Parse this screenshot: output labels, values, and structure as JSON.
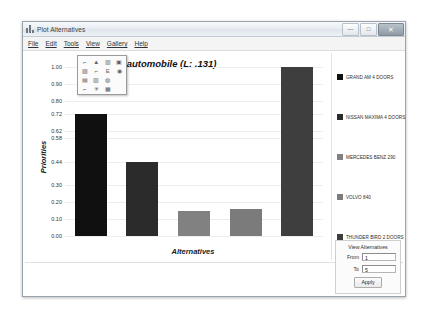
{
  "window": {
    "title": "Plot Alternatives",
    "icon": "bar-chart-icon",
    "buttons": {
      "minimize": "—",
      "maximize": "□",
      "close": "✕"
    }
  },
  "menubar": {
    "items": [
      {
        "label": "File"
      },
      {
        "label": "Edit"
      },
      {
        "label": "Tools"
      },
      {
        "label": "View"
      },
      {
        "label": "Gallery"
      },
      {
        "label": "Help"
      }
    ]
  },
  "gallery_popup": {
    "cells": [
      {
        "icon": "line-chart-icon",
        "glyph": "⌐"
      },
      {
        "icon": "area-chart-icon",
        "glyph": "▲"
      },
      {
        "icon": "bar-chart-icon",
        "glyph": "▥"
      },
      {
        "icon": "stacked-bar-icon",
        "glyph": "▣"
      },
      {
        "icon": "column-chart-icon",
        "glyph": "▨"
      },
      {
        "icon": "step-chart-icon",
        "glyph": "⌐"
      },
      {
        "icon": "histogram-icon",
        "glyph": "Ε"
      },
      {
        "icon": "pie-chart-icon",
        "glyph": "◉"
      },
      {
        "icon": "grouped-bar-icon",
        "glyph": "▤"
      },
      {
        "icon": "range-bar-icon",
        "glyph": "▥"
      },
      {
        "icon": "donut-chart-icon",
        "glyph": "◍"
      },
      {
        "icon": "blank-cell-icon",
        "glyph": ""
      },
      {
        "icon": "scatter-chart-icon",
        "glyph": "⌐"
      },
      {
        "icon": "radar-chart-icon",
        "glyph": "✳"
      },
      {
        "icon": "mixed-chart-icon",
        "glyph": "▦"
      },
      {
        "icon": "blank-cell-icon",
        "glyph": ""
      }
    ]
  },
  "chart_data": {
    "type": "bar",
    "title": "cost of automobile (L: .131)",
    "xlabel": "Alternatives",
    "ylabel": "Priorities",
    "ylim": [
      0,
      1.0
    ],
    "grid": true,
    "legend_position": "right",
    "categories": [
      "GRAND AM 4 DOORS",
      "NISSAN MAXIMA 4 DOORS",
      "MERCEDES BENZ 290",
      "VOLVO 840",
      "THUNDER BIRD 2 DOORS"
    ],
    "values": [
      0.72,
      0.44,
      0.15,
      0.16,
      1.0
    ],
    "colors": [
      "#101010",
      "#2b2b2b",
      "#818181",
      "#7b7b7b",
      "#3e3e3e"
    ],
    "ytick_labels": [
      "1.00",
      "0.90",
      "0.80",
      "0.72",
      "0.62",
      "0.58",
      "0.44",
      "0.30",
      "0.20",
      "0.10",
      "0.00"
    ],
    "ytick_values": [
      1.0,
      0.9,
      0.8,
      0.72,
      0.62,
      0.58,
      0.44,
      0.3,
      0.2,
      0.1,
      0.0
    ]
  },
  "controls": {
    "title": "View Alternatives",
    "from_label": "From",
    "from_value": "1",
    "to_label": "To",
    "to_value": "5",
    "apply_label": "Apply"
  }
}
